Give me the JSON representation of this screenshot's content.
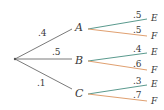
{
  "diagram": {
    "type": "probability-tree",
    "colors": {
      "first_stage": "#7a7a7a",
      "branch_E": "#5a9a8e",
      "branch_F": "#e0a070",
      "text": "#3a3a3a"
    },
    "first_stage": [
      {
        "node": "A",
        "prob": ".4"
      },
      {
        "node": "B",
        "prob": ".5"
      },
      {
        "node": "C",
        "prob": ".1"
      }
    ],
    "second_stage": {
      "A": [
        {
          "outcome": "E",
          "prob": ".5"
        },
        {
          "outcome": "F",
          "prob": ".5"
        }
      ],
      "B": [
        {
          "outcome": "E",
          "prob": ".4"
        },
        {
          "outcome": "F",
          "prob": ".6"
        }
      ],
      "C": [
        {
          "outcome": "E",
          "prob": ".3"
        },
        {
          "outcome": "F",
          "prob": ".7"
        }
      ]
    }
  }
}
